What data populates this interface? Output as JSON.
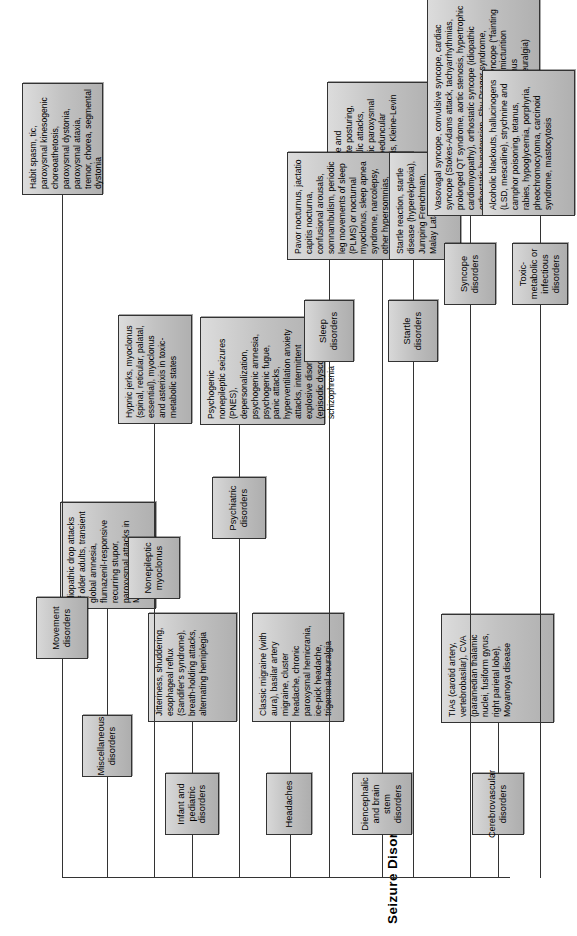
{
  "figure": {
    "title": "Seizure Disorders",
    "orientation": "rotated-90-ccw",
    "background": "#ffffff",
    "node_fill": "#c4c4c4",
    "node_border": "#333333"
  },
  "branches": [
    {
      "id": "cerebrovascular",
      "category": "Cerebrovascular disorders",
      "examples": "TIAs (carotid artery, vertebrobasilar), CVA (paramedian thalamic nuclei, fusiform gyrus, right parietal lobe), Moyamoya disease"
    },
    {
      "id": "diencephalic",
      "category": "Diencephalic and brain stem disorders",
      "examples": "Decorticate and decerebrate posturing, diencephalic attacks, nonepileptic paroxysmal laughter, peduncular hallucinosis, Kleine-Levin syndrome"
    },
    {
      "id": "headaches",
      "category": "Headaches",
      "examples": "Classic migraine (with aura), basilar artery migraine, cluster headache, chronic paroxysmal hemicrania, ice-pick headache, trigeminal neuralgia"
    },
    {
      "id": "infant-pediatric",
      "category": "Infant and pediatric disorders",
      "examples": "Jitteriness, shuddering, esophageal reflux (Sandifer's syndrome), breath-holding attacks, alternating hemiplegia"
    },
    {
      "id": "miscellaneous",
      "category": "Miscellaneous disorders",
      "examples": "Idiopathic drop attacks of older adults, transient global amnesia, flumazenil-responsive recurring stupor, paroxysmal attacks in MS"
    },
    {
      "id": "movement",
      "category": "Movement disorders",
      "examples": "Habit spasm, tic, paroxysmal kinesogenic choreoathetosis, paroxysmal dystonia, paroxysmal ataxia, tremor, chorea, segmental dystonia"
    },
    {
      "id": "nonepileptic-myoclonus",
      "category": "Nonepileptic myoclonus",
      "examples": "Hypnic jerks, myoclonus (spinal, reticular, palatal, essential), myoclonus and asterixis in toxic-metabolic states"
    },
    {
      "id": "psychiatric",
      "category": "Psychiatric disorders",
      "examples": "Psychogenic nonepileptic seizures (PNES), depersonalization, psychogenic amnesia, psychogenic fugue, panic attacks, hyperventilation anxiety attacks, intermittent explosive disorder (episodic dyscontrol), schizophrenia"
    },
    {
      "id": "sleep",
      "category": "Sleep disorders",
      "examples": "Pavor nocturnus, jactatio capitis nocturna, confusional arousals, somnambulism, periodic leg movements of sleep (PLMS) or nocturnal myoclonus, sleep apnea syndrome, narcolepsy, other hypersomnias, rapid eye movement (REM) behavior disorder"
    },
    {
      "id": "startle",
      "category": "Startle disorders",
      "examples": "Startle reaction, startle disease (hyperekplexia), Jumping Frenchman, Malay Latah, etc."
    },
    {
      "id": "syncope",
      "category": "Syncope disorders",
      "examples": "Vasovagal syncope, convulsive syncope, cardiac syncope (Stokes-Adams attack, tachyarrhythmias, prolonged QT syndrome, aortic stenosis, hypertrophic cardiomyopathy), orthostatic syncope (idiopathic orthostatic hypotension, Shy-Drager syndrome, autonomic neuropathy), deliberate syncope (\"fainting lark\"), syncope in specific situations (micturition syncope, tussive syncope, carotid sinus hypersensitivity, glossopharyngeal neuralgia)"
    },
    {
      "id": "toxic-metabolic",
      "category": "Toxic-metabolic or infectious disorders",
      "examples": "Alcoholic blackouts, hallucinogens (LSD, mescaline), strychnine and camphor poisoning, tetanus, rabies, hypoglycemia, porphyria, pheochromocytoma, carcinoid syndrome, mastocytosis"
    }
  ]
}
